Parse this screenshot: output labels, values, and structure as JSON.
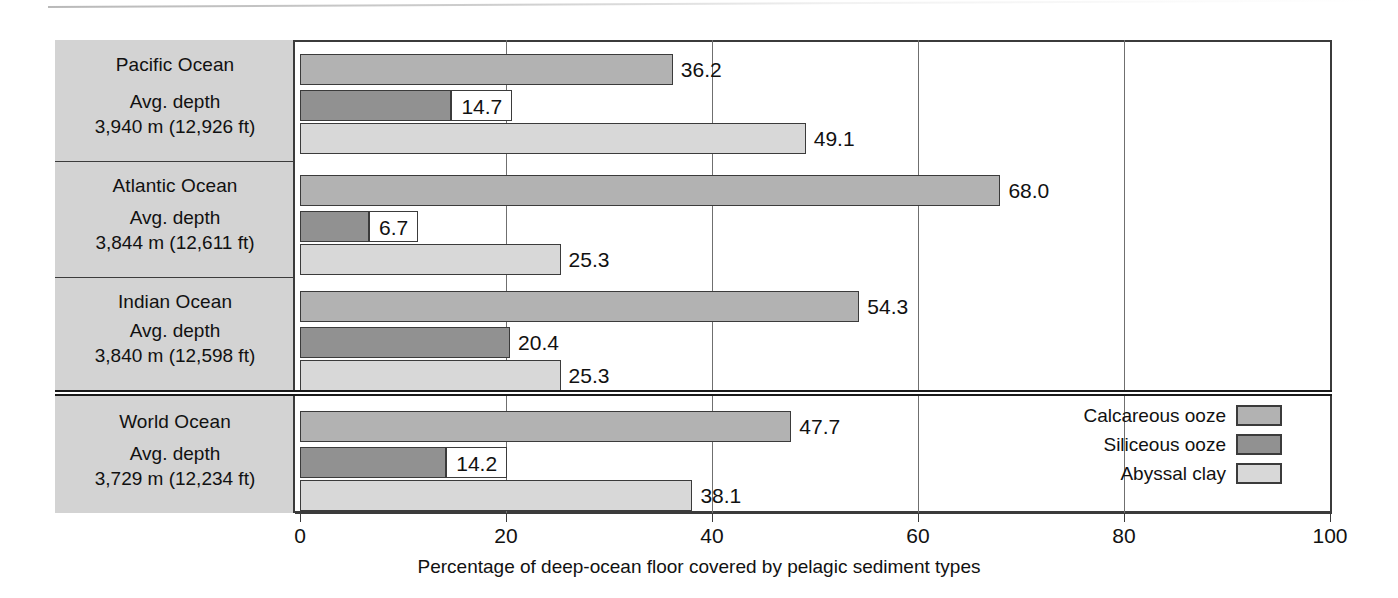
{
  "chart_data": {
    "type": "bar",
    "orientation": "horizontal",
    "title": "",
    "xlabel": "Percentage of deep-ocean floor covered by pelagic sediment types",
    "ylabel": "",
    "xlim": [
      0,
      100
    ],
    "xticks": [
      0,
      20,
      40,
      60,
      80,
      100
    ],
    "xtick_labels": [
      "0",
      "20",
      "40",
      "60",
      "80",
      "100"
    ],
    "grid": true,
    "legend_position": "inside-bottom-right",
    "categories": [
      "Pacific Ocean",
      "Atlantic Ocean",
      "Indian Ocean",
      "World Ocean"
    ],
    "series": [
      {
        "name": "Calcareous ooze",
        "color": "#b2b2b2",
        "values": [
          36.2,
          68.0,
          54.3,
          47.7
        ]
      },
      {
        "name": "Siliceous ooze",
        "color": "#919191",
        "values": [
          14.7,
          6.7,
          20.4,
          14.2
        ]
      },
      {
        "name": "Abyssal clay",
        "color": "#d8d8d8",
        "values": [
          49.1,
          25.3,
          25.3,
          38.1
        ]
      }
    ]
  },
  "axis": {
    "title": "Percentage of deep-ocean floor covered by pelagic sediment types",
    "ticks": [
      {
        "value": 0,
        "label": "0"
      },
      {
        "value": 20,
        "label": "20"
      },
      {
        "value": 40,
        "label": "40"
      },
      {
        "value": 60,
        "label": "60"
      },
      {
        "value": 80,
        "label": "80"
      },
      {
        "value": 100,
        "label": "100"
      }
    ]
  },
  "rows": [
    {
      "name": "Pacific Ocean",
      "depth_caption": "Avg. depth",
      "depth_value": "3,940 m (12,926 ft)",
      "bars": [
        {
          "series": "Calcareous ooze",
          "value": 36.2,
          "label": "36.2",
          "label_style": "plain"
        },
        {
          "series": "Siliceous ooze",
          "value": 14.7,
          "label": "14.7",
          "label_style": "boxed"
        },
        {
          "series": "Abyssal clay",
          "value": 49.1,
          "label": "49.1",
          "label_style": "plain"
        }
      ]
    },
    {
      "name": "Atlantic Ocean",
      "depth_caption": "Avg. depth",
      "depth_value": "3,844 m (12,611 ft)",
      "bars": [
        {
          "series": "Calcareous ooze",
          "value": 68.0,
          "label": "68.0",
          "label_style": "plain"
        },
        {
          "series": "Siliceous ooze",
          "value": 6.7,
          "label": "6.7",
          "label_style": "boxed"
        },
        {
          "series": "Abyssal clay",
          "value": 25.3,
          "label": "25.3",
          "label_style": "plain"
        }
      ]
    },
    {
      "name": "Indian Ocean",
      "depth_caption": "Avg. depth",
      "depth_value": "3,840 m (12,598 ft)",
      "bars": [
        {
          "series": "Calcareous ooze",
          "value": 54.3,
          "label": "54.3",
          "label_style": "plain"
        },
        {
          "series": "Siliceous ooze",
          "value": 20.4,
          "label": "20.4",
          "label_style": "plain"
        },
        {
          "series": "Abyssal clay",
          "value": 25.3,
          "label": "25.3",
          "label_style": "plain"
        }
      ]
    },
    {
      "name": "World Ocean",
      "depth_caption": "Avg. depth",
      "depth_value": "3,729 m (12,234 ft)",
      "bars": [
        {
          "series": "Calcareous ooze",
          "value": 47.7,
          "label": "47.7",
          "label_style": "plain"
        },
        {
          "series": "Siliceous ooze",
          "value": 14.2,
          "label": "14.2",
          "label_style": "boxed"
        },
        {
          "series": "Abyssal clay",
          "value": 38.1,
          "label": "38.1",
          "label_style": "plain"
        }
      ]
    }
  ],
  "legend": {
    "items": [
      {
        "label": "Calcareous ooze",
        "swatch": "calc",
        "color": "#b2b2b2"
      },
      {
        "label": "Siliceous ooze",
        "swatch": "sil",
        "color": "#919191"
      },
      {
        "label": "Abyssal clay",
        "swatch": "clay",
        "color": "#d8d8d8"
      }
    ]
  },
  "colors": {
    "calcareous": "#b2b2b2",
    "siliceous": "#919191",
    "abyssal": "#d8d8d8",
    "panel": "#d3d3d3",
    "stroke": "#3b3b3b",
    "grid": "#6f6f6f"
  }
}
